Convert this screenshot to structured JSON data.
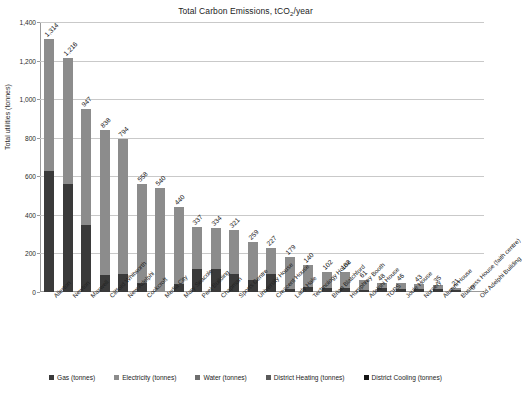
{
  "chart_data": {
    "type": "bar",
    "stacked": true,
    "title": "Total Carbon Emissions, tCO2/year",
    "title_prefix": "Total Carbon Emissions, tCO",
    "title_sub": "2",
    "title_suffix": "/year",
    "xlabel": "",
    "ylabel": "Total utilities (tonnes)",
    "ylim": [
      0,
      1400
    ],
    "ytick_labels": [
      "0",
      "200",
      "400",
      "600",
      "800",
      "1,000",
      "1,200",
      "1,400"
    ],
    "ytick_values": [
      0,
      200,
      400,
      600,
      800,
      1000,
      1200,
      1400
    ],
    "grid": true,
    "legend_position": "bottom",
    "categories": [
      "Allerton",
      "Newton",
      "Maxwell",
      "Clifford Whitworth",
      "New Adelphi",
      "Cockcroft",
      "Media City",
      "Mary Seacole",
      "Peel Building",
      "Chapman",
      "Sports Centre",
      "University House",
      "Crescent House",
      "Lady Hale",
      "Technology House",
      "Brian Blatchford",
      "Humphrey Booth",
      "Adelphi House",
      "TOPS",
      "Joule House",
      "Nursery",
      "Alumni House",
      "Business House (faith centre)",
      "Old Adelphi Building"
    ],
    "totals": [
      1314,
      1216,
      947,
      838,
      794,
      558,
      540,
      440,
      337,
      334,
      321,
      259,
      227,
      179,
      140,
      102,
      102,
      61,
      48,
      46,
      43,
      35,
      21,
      0
    ],
    "series": [
      {
        "name": "Gas (tonnes)",
        "color": "#3a3a3a",
        "values": [
          630,
          560,
          345,
          90,
          95,
          45,
          0,
          40,
          120,
          118,
          95,
          60,
          95,
          18,
          25,
          22,
          22,
          12,
          20,
          18,
          17,
          14,
          9,
          0
        ]
      },
      {
        "name": "Electricity  (tonnes)",
        "color": "#8c8c8c",
        "values": [
          684,
          656,
          602,
          748,
          699,
          513,
          540,
          400,
          217,
          216,
          226,
          199,
          132,
          161,
          115,
          80,
          80,
          49,
          28,
          28,
          26,
          21,
          12,
          0
        ]
      },
      {
        "name": "Water  (tonnes)",
        "color": "#6e6e6e",
        "values": [
          0,
          0,
          0,
          0,
          0,
          0,
          0,
          0,
          0,
          0,
          0,
          0,
          0,
          0,
          0,
          0,
          0,
          0,
          0,
          0,
          0,
          0,
          0,
          0
        ]
      },
      {
        "name": "District Heating (tonnes)",
        "color": "#5a5a5a",
        "values": [
          0,
          0,
          0,
          0,
          0,
          0,
          0,
          0,
          0,
          0,
          0,
          0,
          0,
          0,
          0,
          0,
          0,
          0,
          0,
          0,
          0,
          0,
          0,
          0
        ]
      },
      {
        "name": "District Cooling (tonnes)",
        "color": "#151515",
        "values": [
          0,
          0,
          0,
          0,
          0,
          0,
          0,
          0,
          0,
          0,
          0,
          0,
          0,
          0,
          0,
          0,
          0,
          0,
          0,
          0,
          0,
          0,
          0,
          0
        ]
      }
    ],
    "data_labels": [
      "1,314",
      "1,216",
      "947",
      "838",
      "794",
      "558",
      "540",
      "440",
      "337",
      "334",
      "321",
      "259",
      "227",
      "179",
      "140",
      "102",
      "102",
      "61",
      "48",
      "46",
      "43",
      "35",
      "21",
      "0"
    ],
    "legend": [
      {
        "label": "Gas (tonnes)",
        "color": "#3a3a3a"
      },
      {
        "label": "Electricity  (tonnes)",
        "color": "#8c8c8c"
      },
      {
        "label": "Water  (tonnes)",
        "color": "#6e6e6e"
      },
      {
        "label": "District Heating (tonnes)",
        "color": "#5a5a5a"
      },
      {
        "label": "District Cooling (tonnes)",
        "color": "#151515"
      }
    ]
  }
}
